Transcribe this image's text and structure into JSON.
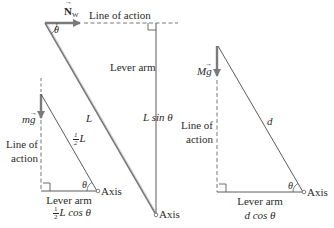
{
  "colors": {
    "line": "#3a3a3a",
    "force_arrow": "#7a7a7a",
    "dashed": "#555555",
    "text": "#2a2a2a"
  },
  "top_diagram": {
    "force_label": "N",
    "force_subscript": "W",
    "line_of_action": "Line of action",
    "angle": "θ",
    "lever_arm": "Lever arm",
    "ladder_length": "L",
    "lever_arm_expr": "L sin θ",
    "axis": "Axis"
  },
  "left_diagram": {
    "force_label": "mg",
    "line_of_action_line1": "Line of",
    "line_of_action_line2": "action",
    "half_length_num": "1",
    "half_length_den": "2",
    "half_length_var": "L",
    "angle": "θ",
    "axis": "Axis",
    "lever_arm": "Lever arm",
    "lever_arm_frac_num": "1",
    "lever_arm_frac_den": "2",
    "lever_arm_expr": "L cos θ"
  },
  "right_diagram": {
    "force_label": "Mg",
    "line_of_action_line1": "Line of",
    "line_of_action_line2": "action",
    "length": "d",
    "angle": "θ",
    "axis": "Axis",
    "lever_arm": "Lever arm",
    "lever_arm_expr": "d cos θ"
  }
}
